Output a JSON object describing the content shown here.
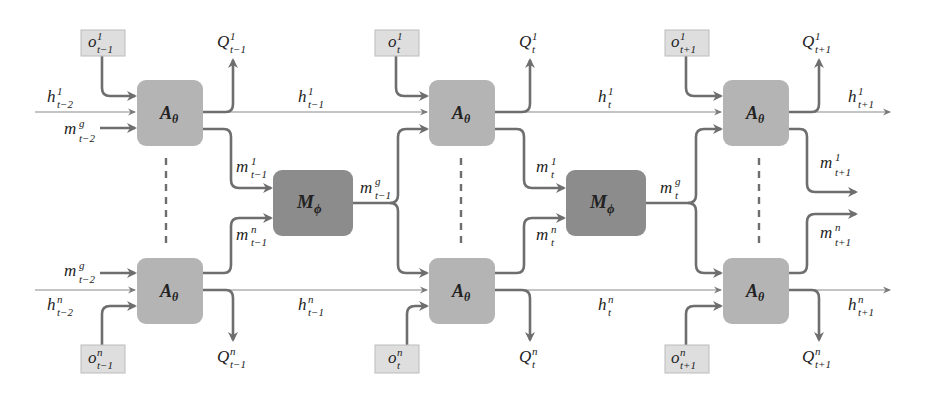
{
  "diagram": {
    "title": "",
    "colors": {
      "agent_box": "#b4b4b4",
      "mixer_box": "#8c8c8c",
      "obs_box": "#dedede",
      "arrow": "#6e6e6e",
      "thin_line": "#8a8a8a",
      "text": "#222222"
    },
    "columns": [
      {
        "id": "t-1",
        "agent_top": {
          "label": "A",
          "sub": "θ"
        },
        "agent_bottom": {
          "label": "A",
          "sub": "θ"
        },
        "obs_top": {
          "base": "o",
          "sup": "1",
          "sub": "t−1"
        },
        "obs_bottom": {
          "base": "o",
          "sup": "n",
          "sub": "t−1"
        },
        "q_top": {
          "base": "Q",
          "sup": "1",
          "sub": "t−1"
        },
        "q_bottom": {
          "base": "Q",
          "sup": "n",
          "sub": "t−1"
        },
        "h_in_top": {
          "base": "h",
          "sup": "1",
          "sub": "t−2"
        },
        "h_in_bottom": {
          "base": "h",
          "sup": "n",
          "sub": "t−2"
        },
        "mg_in_top": {
          "base": "m",
          "sup": "g",
          "sub": "t−2"
        },
        "mg_in_bottom": {
          "base": "m",
          "sup": "g",
          "sub": "t−2"
        },
        "m_out_top": {
          "base": "m",
          "sup": "1",
          "sub": "t−1"
        },
        "m_out_bottom": {
          "base": "m",
          "sup": "n",
          "sub": "t−1"
        },
        "h_out_top": {
          "base": "h",
          "sup": "1",
          "sub": "t−1"
        },
        "h_out_bottom": {
          "base": "h",
          "sup": "n",
          "sub": "t−1"
        }
      },
      {
        "id": "t",
        "agent_top": {
          "label": "A",
          "sub": "θ"
        },
        "agent_bottom": {
          "label": "A",
          "sub": "θ"
        },
        "obs_top": {
          "base": "o",
          "sup": "1",
          "sub": "t"
        },
        "obs_bottom": {
          "base": "o",
          "sup": "n",
          "sub": "t"
        },
        "q_top": {
          "base": "Q",
          "sup": "1",
          "sub": "t"
        },
        "q_bottom": {
          "base": "Q",
          "sup": "n",
          "sub": "t"
        },
        "m_out_top": {
          "base": "m",
          "sup": "1",
          "sub": "t"
        },
        "m_out_bottom": {
          "base": "m",
          "sup": "n",
          "sub": "t"
        },
        "h_out_top": {
          "base": "h",
          "sup": "1",
          "sub": "t"
        },
        "h_out_bottom": {
          "base": "h",
          "sup": "n",
          "sub": "t"
        }
      },
      {
        "id": "t+1",
        "agent_top": {
          "label": "A",
          "sub": "θ"
        },
        "agent_bottom": {
          "label": "A",
          "sub": "θ"
        },
        "obs_top": {
          "base": "o",
          "sup": "1",
          "sub": "t+1"
        },
        "obs_bottom": {
          "base": "o",
          "sup": "n",
          "sub": "t+1"
        },
        "q_top": {
          "base": "Q",
          "sup": "1",
          "sub": "t+1"
        },
        "q_bottom": {
          "base": "Q",
          "sup": "n",
          "sub": "t+1"
        },
        "m_out_top": {
          "base": "m",
          "sup": "1",
          "sub": "t+1"
        },
        "m_out_bottom": {
          "base": "m",
          "sup": "n",
          "sub": "t+1"
        },
        "h_out_top": {
          "base": "h",
          "sup": "1",
          "sub": "t+1"
        },
        "h_out_bottom": {
          "base": "h",
          "sup": "n",
          "sub": "t+1"
        }
      }
    ],
    "mixers": [
      {
        "label": "M",
        "sub": "ϕ",
        "out": {
          "base": "m",
          "sup": "g",
          "sub": "t−1"
        }
      },
      {
        "label": "M",
        "sub": "ϕ",
        "out": {
          "base": "m",
          "sup": "g",
          "sub": "t"
        }
      }
    ]
  }
}
